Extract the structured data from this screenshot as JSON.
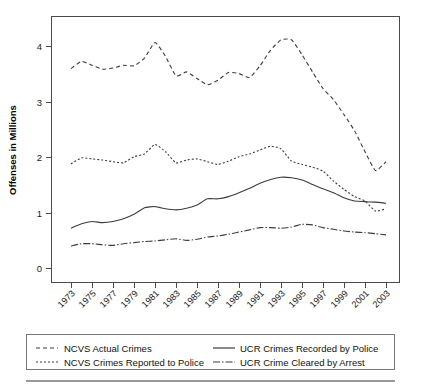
{
  "chart_data": {
    "type": "line",
    "title": "",
    "xlabel": "",
    "ylabel": "Offenses in Millions",
    "xlim": [
      1973,
      2003
    ],
    "ylim": [
      -0.25,
      4.55
    ],
    "yticks": [
      0,
      1,
      2,
      3,
      4
    ],
    "ytick_labels": [
      "0",
      "1",
      "2",
      "3",
      "4"
    ],
    "xticks": [
      1973,
      1975,
      1977,
      1979,
      1981,
      1983,
      1985,
      1987,
      1989,
      1991,
      1993,
      1995,
      1997,
      1999,
      2001,
      2003
    ],
    "xtick_labels": [
      "1973",
      "1975",
      "1977",
      "1979",
      "1981",
      "1983",
      "1985",
      "1987",
      "1989",
      "1991",
      "1993",
      "1995",
      "1997",
      "1999",
      "2001",
      "2003"
    ],
    "grid": false,
    "legend_position": "below-plot",
    "x": [
      1973,
      1974,
      1975,
      1976,
      1977,
      1978,
      1979,
      1980,
      1981,
      1982,
      1983,
      1984,
      1985,
      1986,
      1987,
      1988,
      1989,
      1990,
      1991,
      1992,
      1993,
      1994,
      1995,
      1996,
      1997,
      1998,
      1999,
      2000,
      2001,
      2002,
      2003
    ],
    "series": [
      {
        "name": "NCVS Actual Crimes",
        "dash": "4,3",
        "values": [
          3.61,
          3.74,
          3.67,
          3.6,
          3.62,
          3.67,
          3.66,
          3.8,
          4.08,
          3.83,
          3.48,
          3.55,
          3.43,
          3.32,
          3.4,
          3.54,
          3.52,
          3.45,
          3.66,
          3.94,
          4.13,
          4.13,
          3.86,
          3.55,
          3.25,
          3.05,
          2.78,
          2.49,
          2.11,
          1.77,
          1.93
        ]
      },
      {
        "name": "NCVS Crimes Reported to Police",
        "dash": "2,2",
        "values": [
          1.89,
          2.0,
          1.98,
          1.96,
          1.93,
          1.91,
          2.02,
          2.07,
          2.24,
          2.11,
          1.91,
          1.96,
          1.98,
          1.93,
          1.88,
          1.94,
          2.02,
          2.07,
          2.14,
          2.21,
          2.16,
          1.94,
          1.88,
          1.83,
          1.76,
          1.58,
          1.43,
          1.3,
          1.22,
          1.04,
          1.08
        ]
      },
      {
        "name": "UCR Crimes Recorded by Police",
        "dash": "none",
        "values": [
          0.73,
          0.81,
          0.85,
          0.83,
          0.85,
          0.9,
          0.98,
          1.1,
          1.12,
          1.08,
          1.06,
          1.09,
          1.15,
          1.26,
          1.26,
          1.3,
          1.37,
          1.45,
          1.54,
          1.61,
          1.65,
          1.64,
          1.6,
          1.52,
          1.44,
          1.37,
          1.28,
          1.22,
          1.21,
          1.2,
          1.18
        ]
      },
      {
        "name": "UCR Crime Cleared by Arrest",
        "dash": "7,2,1.5,2",
        "values": [
          0.41,
          0.45,
          0.45,
          0.43,
          0.42,
          0.45,
          0.47,
          0.49,
          0.5,
          0.52,
          0.54,
          0.51,
          0.53,
          0.57,
          0.59,
          0.62,
          0.66,
          0.7,
          0.74,
          0.74,
          0.73,
          0.75,
          0.8,
          0.79,
          0.74,
          0.71,
          0.68,
          0.66,
          0.65,
          0.63,
          0.61
        ]
      }
    ]
  },
  "legend": {
    "items": [
      {
        "label": "NCVS Actual Crimes",
        "dash": "4,3"
      },
      {
        "label": "NCVS Crimes Reported to Police",
        "dash": "2,2"
      },
      {
        "label": "UCR Crimes Recorded by Police",
        "dash": "none"
      },
      {
        "label": "UCR Crime Cleared by Arrest",
        "dash": "7,2,1.5,2"
      }
    ]
  },
  "colors": {
    "line": "#3c3c3c",
    "axis": "#4a4a4a",
    "legend_border": "#777777",
    "footer_rule": "#9a9a9a",
    "background": "#ffffff"
  }
}
